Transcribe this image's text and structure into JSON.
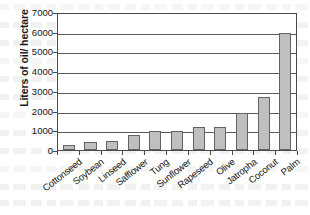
{
  "chart_data": {
    "type": "bar",
    "title": "",
    "xlabel": "",
    "ylabel": "Liters of oil/ hectare",
    "ylim": [
      0,
      7000
    ],
    "ytick_step": 1000,
    "yticks": [
      "0",
      "1000",
      "2000",
      "3000",
      "4000",
      "5000",
      "6000",
      "7000"
    ],
    "grid": true,
    "legend": false,
    "bar_color": "#bfbfbf",
    "bar_border_color": "#636363",
    "axis_color": "#4a4a4a",
    "categories": [
      "Cottonseed",
      "Soybean",
      "Linseed",
      "Safflower",
      "Tung",
      "Sunflower",
      "Rapeseed",
      "Olive",
      "Jatropha",
      "Coconut",
      "Palm"
    ],
    "values": [
      270,
      420,
      480,
      780,
      950,
      950,
      1190,
      1160,
      1890,
      2670,
      5950
    ]
  }
}
